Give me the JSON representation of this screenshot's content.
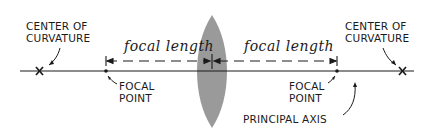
{
  "diagram": {
    "labels": {
      "center_left": {
        "line1": "CENTER OF",
        "line2": "CURVATURE"
      },
      "center_right": {
        "line1": "CENTER OF",
        "line2": "CURVATURE"
      },
      "focal_point_left": {
        "line1": "FOCAL",
        "line2": "POINT"
      },
      "focal_point_right": {
        "line1": "FOCAL",
        "line2": "POINT"
      },
      "focal_length_left": "focal length",
      "focal_length_right": "focal length",
      "principal_axis": "PRINCIPAL AXIS"
    },
    "markers": {
      "center_left_symbol": "x",
      "center_right_symbol": "x"
    },
    "colors": {
      "lens_fill": "#9a9a9a",
      "ink": "#1a1a1a",
      "background": "#ffffff"
    }
  }
}
